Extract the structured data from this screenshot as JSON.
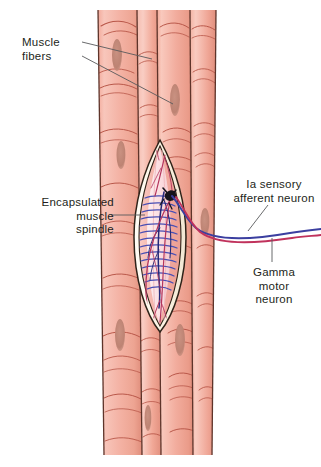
{
  "figure": {
    "background_color": "#ffffff"
  },
  "labels": {
    "muscle_fibers": "Muscle\nfibers",
    "encapsulated_muscle_spindle": "Encapsulated\nmuscle\nspindle",
    "ia_sensory_afferent_neuron": "Ia sensory\nafferent neuron",
    "gamma_motor_neuron": "Gamma\nmotor\nneuron"
  },
  "colors": {
    "text": "#231f20",
    "leader_line": "#58595b",
    "muscle_fiber_light": "#f6bdb2",
    "muscle_fiber_mid": "#f0a697",
    "muscle_fiber_dark": "#e3907f",
    "muscle_fiber_edge": "#6b3b30",
    "muscle_striation": "#b9584a",
    "muscle_nucleus": "#c08476",
    "capsule_outline": "#3a2a20",
    "capsule_wall": "#fdf6e8",
    "spindle_interior": "#f6b7ae",
    "spindle_core_pale": "#fde4e6",
    "intrafusal_fiber": "#fbd3d6",
    "sensory_nerve_blue": "#3b3fa0",
    "annulospiral_blue": "#4a4fb4",
    "motor_nerve_red": "#c0325c",
    "nerve_branch_red": "#b5365e",
    "synapse_dark": "#1b1b22"
  },
  "anatomy": {
    "muscle_fiber_count": 4,
    "fiber_columns": [
      {
        "name": "fiber-1",
        "x_top": 98,
        "x_bottom": 104,
        "width": 39
      },
      {
        "name": "fiber-2",
        "x_top": 137,
        "x_bottom": 142,
        "width": 20
      },
      {
        "name": "fiber-3",
        "x_top": 157,
        "x_bottom": 161,
        "width": 33
      },
      {
        "name": "fiber-4",
        "x_top": 190,
        "x_bottom": 193,
        "width": 25
      }
    ],
    "muscle_block": {
      "top": 10,
      "bottom": 455,
      "left": 98,
      "right": 216
    },
    "spindle": {
      "center_x": 160,
      "top": 142,
      "bottom": 330,
      "max_width": 46
    },
    "nerve_exit": {
      "x": 176,
      "y": 196
    },
    "nerve_run_right_edge": 321
  }
}
